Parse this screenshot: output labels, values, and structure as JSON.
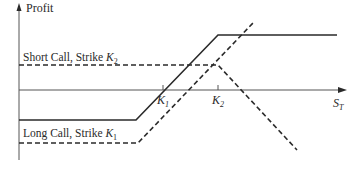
{
  "diagram": {
    "axes": {
      "y_label": "Profit",
      "x_label_main": "S",
      "x_label_sub": "T"
    },
    "strikes": [
      {
        "id": "K1",
        "main": "K",
        "sub": "1",
        "x": 163
      },
      {
        "id": "K2",
        "main": "K",
        "sub": "2",
        "x": 218
      }
    ],
    "labels": {
      "short_call_text": "Short Call, Strike ",
      "short_call_k_main": "K",
      "short_call_k_sub": "2",
      "long_call_text": "Long Call, Strike ",
      "long_call_k_main": "K",
      "long_call_k_sub": "1"
    },
    "series": [
      {
        "name": "Bull spread (net profit)",
        "style": "solid",
        "points": [
          [
            19,
            120
          ],
          [
            136,
            120
          ],
          [
            218,
            35
          ],
          [
            337,
            35
          ]
        ]
      },
      {
        "name": "Short Call, Strike K2",
        "style": "dashed",
        "points": [
          [
            19,
            65
          ],
          [
            218,
            65
          ],
          [
            297,
            150
          ]
        ]
      },
      {
        "name": "Long Call, Strike K1",
        "style": "dashed",
        "points": [
          [
            19,
            143
          ],
          [
            138,
            143
          ],
          [
            253,
            23
          ]
        ]
      }
    ],
    "colors": {
      "line": "#2a2a2a",
      "axis": "#555555",
      "background": "#ffffff"
    }
  }
}
